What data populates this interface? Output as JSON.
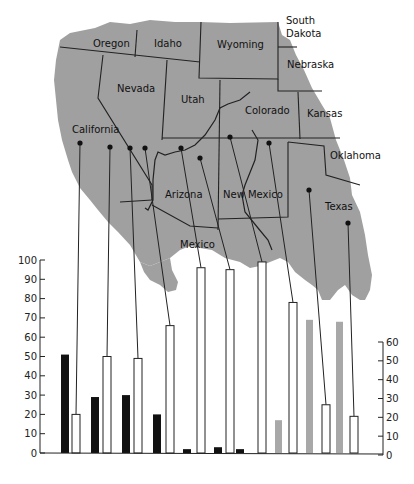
{
  "map": {
    "fill_color": "#a0a0a0",
    "labels": [
      {
        "id": "oregon",
        "text": "Oregon"
      },
      {
        "id": "idaho",
        "text": "Idaho"
      },
      {
        "id": "wyoming",
        "text": "Wyoming"
      },
      {
        "id": "south-dakota-1",
        "text": "South"
      },
      {
        "id": "south-dakota-2",
        "text": "Dakota"
      },
      {
        "id": "nebraska",
        "text": "Nebraska"
      },
      {
        "id": "nevada",
        "text": "Nevada"
      },
      {
        "id": "utah",
        "text": "Utah"
      },
      {
        "id": "colorado",
        "text": "Colorado"
      },
      {
        "id": "kansas",
        "text": "Kansas"
      },
      {
        "id": "california",
        "text": "California"
      },
      {
        "id": "oklahoma",
        "text": "Oklahoma"
      },
      {
        "id": "arizona",
        "text": "Arizona"
      },
      {
        "id": "new-mexico",
        "text": "New Mexico"
      },
      {
        "id": "texas",
        "text": "Texas"
      },
      {
        "id": "mexico",
        "text": "Mexico"
      }
    ]
  },
  "chart_data": {
    "type": "bar",
    "title": "",
    "xlabel": "",
    "ylabel": "",
    "ylim": [
      0,
      100
    ],
    "y2lim": [
      0,
      60
    ],
    "yticks": [
      "0",
      "10",
      "20",
      "30",
      "40",
      "50",
      "60",
      "70",
      "80",
      "90",
      "100"
    ],
    "y2ticks": [
      "0",
      "10",
      "20",
      "30",
      "40",
      "50",
      "60"
    ],
    "grid": false,
    "legend": "none",
    "colors": {
      "black": "#111111",
      "white": "#ffffff",
      "gray": "#a8a8a8",
      "outline": "#222222"
    },
    "groups": [
      {
        "black": 51,
        "white": 20
      },
      {
        "black": 29,
        "white": 50
      },
      {
        "black": 30,
        "white": 49
      },
      {
        "black": 20,
        "white": 66
      },
      {
        "black": 2,
        "white": 96
      },
      {
        "black": 3,
        "white": 95
      },
      {
        "black": 2,
        "white": 99
      },
      {
        "gray": 17,
        "white": 78
      },
      {
        "gray": 69,
        "white": 25
      },
      {
        "gray": 68,
        "white": 19
      }
    ],
    "site_markers": 10
  }
}
